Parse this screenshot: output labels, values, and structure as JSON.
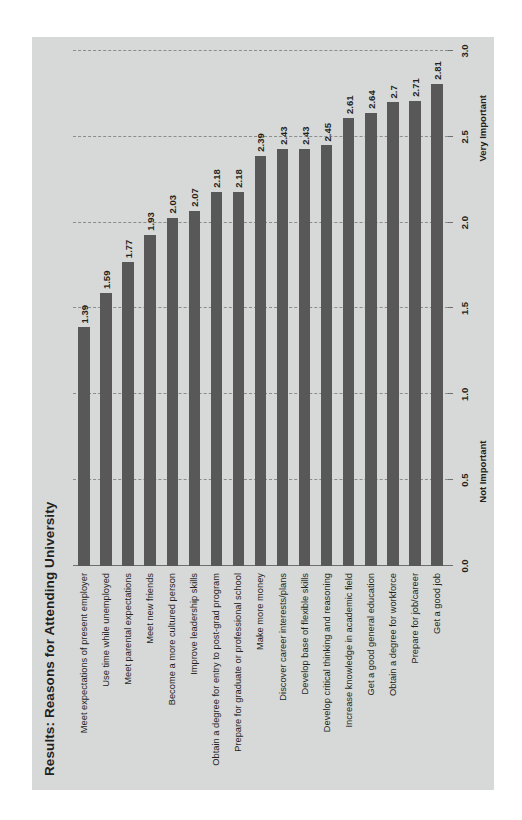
{
  "figure": {
    "title": "Results: Reasons for Attending University",
    "background_color": "#d7d8d8",
    "bar_color": "#585858",
    "text_color": "#231f20"
  },
  "axis": {
    "left_anchor_label": "Not Important",
    "right_anchor_label": "Very Important",
    "ticks": [
      "0.0",
      "0.5",
      "1.0",
      "1.5",
      "2.0",
      "2.5",
      "3.0"
    ]
  },
  "chart_data": {
    "type": "bar",
    "title": "Results: Reasons for Attending University",
    "orientation": "vertical",
    "xlabel": "",
    "ylabel": "",
    "ylim": [
      0.0,
      3.0
    ],
    "yticks": [
      0.0,
      0.5,
      1.0,
      1.5,
      2.0,
      2.5,
      3.0
    ],
    "ytick_labels": [
      "0.0",
      "0.5",
      "1.0",
      "1.5",
      "2.0",
      "2.5",
      "3.0"
    ],
    "axis_anchor_labels": [
      "Not Important",
      "Very Important"
    ],
    "grid": "dashed vertical gridlines at each 0.5 increment",
    "legend": null,
    "bar_color": "#585858",
    "categories": [
      "Meet expectations of present employer",
      "Use time while unemployed",
      "Meet parental expectations",
      "Meet new friends",
      "Become a more cultured person",
      "Improve leadership skills",
      "Obtain a degree for entry to post-grad program",
      "Prepare for graduate or professional school",
      "Make more money",
      "Discover career interests/plans",
      "Develop base of flexible skills",
      "Develop critical thinking and reasoning",
      "Increase knowledge in academic field",
      "Get a good general education",
      "Obtain a degree for workforce",
      "Prepare for job/career",
      "Get a good job"
    ],
    "values": [
      1.39,
      1.59,
      1.77,
      1.93,
      2.03,
      2.07,
      2.18,
      2.18,
      2.39,
      2.43,
      2.43,
      2.45,
      2.61,
      2.64,
      2.7,
      2.71,
      2.81
    ],
    "value_labels": [
      "1.39",
      "1.59",
      "1.77",
      "1.93",
      "2.03",
      "2.07",
      "2.18",
      "2.18",
      "2.39",
      "2.43",
      "2.43",
      "2.45",
      "2.61",
      "2.64",
      "2.7",
      "2.71",
      "2.81"
    ]
  }
}
